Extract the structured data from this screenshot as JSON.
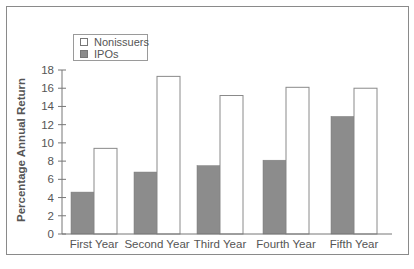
{
  "chart_data": {
    "type": "bar",
    "title": "",
    "xlabel": "",
    "ylabel": "Percentage Annual Return",
    "ylim": [
      0,
      18
    ],
    "yticks": [
      0,
      2,
      4,
      6,
      8,
      10,
      12,
      14,
      16,
      18
    ],
    "grid": false,
    "legend_position": "upper-left",
    "categories": [
      "First Year",
      "Second Year",
      "Third Year",
      "Fourth Year",
      "Fifth Year"
    ],
    "series": [
      {
        "name": "IPOs",
        "color": "#8c8c8c",
        "values": [
          4.6,
          6.8,
          7.5,
          8.1,
          12.9
        ]
      },
      {
        "name": "Nonissuers",
        "color": "#ffffff",
        "values": [
          9.4,
          17.3,
          15.2,
          16.1,
          16.0
        ]
      }
    ]
  },
  "legend": {
    "items": [
      {
        "label": "Nonissuers",
        "color": "#ffffff"
      },
      {
        "label": "IPOs",
        "color": "#8c8c8c"
      }
    ]
  },
  "colors": {
    "axis": "#777777",
    "frame": "#8a8a8a",
    "text": "#555555"
  }
}
